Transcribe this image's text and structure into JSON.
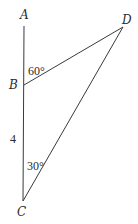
{
  "diagram": {
    "type": "geometry-triangle",
    "points": {
      "A": {
        "label": "A",
        "x": 24,
        "y": 26
      },
      "B": {
        "label": "B",
        "x": 24,
        "y": 85
      },
      "C": {
        "label": "C",
        "x": 23,
        "y": 201
      },
      "D": {
        "label": "D",
        "x": 123,
        "y": 27
      }
    },
    "segments": [
      {
        "from": "A",
        "to": "C"
      },
      {
        "from": "B",
        "to": "D"
      },
      {
        "from": "C",
        "to": "D"
      }
    ],
    "annotations": {
      "angle_ABD": "60°",
      "side_BC": "4",
      "angle_BCD": "30°"
    },
    "line_color": "#3a3a3a",
    "text_color": "#2b2b2b"
  }
}
